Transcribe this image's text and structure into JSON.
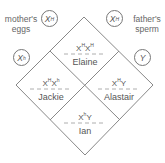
{
  "labels": {
    "mother": "mother's eggs",
    "mother_l1": "mother's",
    "mother_l2": "eggs",
    "father": "father's sperm",
    "father_l1": "father's",
    "father_l2": "sperm"
  },
  "gametes": {
    "mother_top": {
      "base": "X",
      "sup": "H"
    },
    "mother_bottom": {
      "base": "X",
      "sup": "h"
    },
    "father_top": {
      "base": "X",
      "sup": "H"
    },
    "father_bottom": {
      "base": "Y",
      "sup": ""
    }
  },
  "offspring": [
    {
      "name": "Elaine",
      "genotype_a": "X",
      "sup_a": "H",
      "genotype_b": "X",
      "sup_b": "H"
    },
    {
      "name": "Jackie",
      "genotype_a": "X",
      "sup_a": "H",
      "genotype_b": "X",
      "sup_b": "h"
    },
    {
      "name": "Alastair",
      "genotype_a": "X",
      "sup_a": "H",
      "genotype_b": "Y",
      "sup_b": ""
    },
    {
      "name": "Ian",
      "genotype_a": "X",
      "sup_a": "h",
      "genotype_b": "Y",
      "sup_b": ""
    }
  ],
  "colors": {
    "line": "#808080",
    "dash": "#999999",
    "text": "#555555"
  }
}
